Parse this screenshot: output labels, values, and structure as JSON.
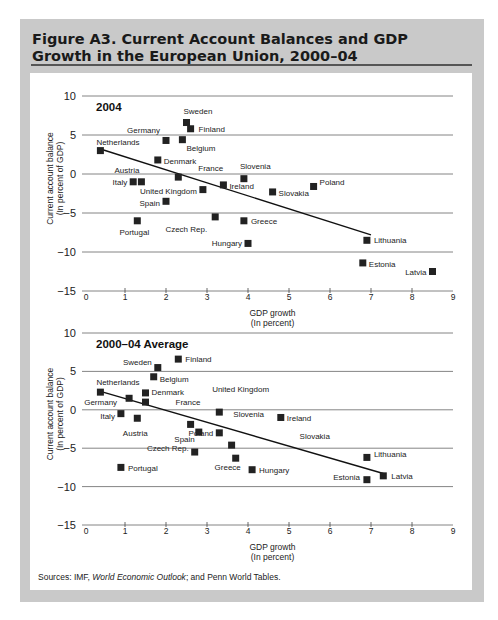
{
  "figure": {
    "title": "Figure A3.  Current Account Balances and GDP Growth in the European Union, 2000–04",
    "source_prefix": "Sources: IMF, ",
    "source_italic": "World Economic Outlook",
    "source_suffix": "; and Penn World Tables."
  },
  "colors": {
    "frame": "#c9c9c9",
    "marker": "#222222",
    "gridline": "#777777",
    "trendline": "#111111"
  },
  "chart_data": [
    {
      "type": "scatter",
      "title": "2004",
      "xlabel": "GDP growth (In percent)",
      "ylabel": "Current account balance (In percent of GDP)",
      "xlim": [
        0,
        9
      ],
      "ylim": [
        -15,
        10
      ],
      "xticks": [
        0,
        1,
        2,
        3,
        4,
        5,
        6,
        7,
        8,
        9
      ],
      "yticks": [
        10,
        5,
        0,
        -5,
        -10,
        -15
      ],
      "grid": "horizontal",
      "trendline": {
        "x": [
          0.4,
          7.0
        ],
        "y": [
          3.2,
          -7.8
        ]
      },
      "points": [
        {
          "label": "Netherlands",
          "x": 0.4,
          "y": 3.0
        },
        {
          "label": "Germany",
          "x": 2.0,
          "y": 4.3
        },
        {
          "label": "Sweden",
          "x": 2.5,
          "y": 6.6
        },
        {
          "label": "Finland",
          "x": 2.6,
          "y": 5.8
        },
        {
          "label": "Belgium",
          "x": 2.4,
          "y": 4.4
        },
        {
          "label": "Denmark",
          "x": 1.8,
          "y": 1.8
        },
        {
          "label": "France",
          "x": 2.3,
          "y": -0.4
        },
        {
          "label": "Austria",
          "x": 1.4,
          "y": -1.0
        },
        {
          "label": "Italy",
          "x": 1.2,
          "y": -1.0
        },
        {
          "label": "United Kingdom",
          "x": 2.9,
          "y": -2.0
        },
        {
          "label": "Spain",
          "x": 2.0,
          "y": -3.5
        },
        {
          "label": "Slovenia",
          "x": 3.9,
          "y": -0.6
        },
        {
          "label": "Ireland",
          "x": 3.4,
          "y": -1.4
        },
        {
          "label": "Slovakia",
          "x": 4.6,
          "y": -2.3
        },
        {
          "label": "Poland",
          "x": 5.6,
          "y": -1.6
        },
        {
          "label": "Portugal",
          "x": 1.3,
          "y": -6.0
        },
        {
          "label": "Czech Rep.",
          "x": 3.2,
          "y": -5.5
        },
        {
          "label": "Greece",
          "x": 3.9,
          "y": -6.0
        },
        {
          "label": "Hungary",
          "x": 4.0,
          "y": -8.9
        },
        {
          "label": "Lithuania",
          "x": 6.9,
          "y": -8.5
        },
        {
          "label": "Estonia",
          "x": 6.8,
          "y": -11.4
        },
        {
          "label": "Latvia",
          "x": 8.5,
          "y": -12.5
        }
      ]
    },
    {
      "type": "scatter",
      "title": "2000–04 Average",
      "xlabel": "GDP growth (In percent)",
      "ylabel": "Current account balance (In percent of GDP)",
      "xlim": [
        0,
        9
      ],
      "ylim": [
        -15,
        10
      ],
      "xticks": [
        0,
        1,
        2,
        3,
        4,
        5,
        6,
        7,
        8,
        9
      ],
      "yticks": [
        10,
        5,
        0,
        -5,
        -10,
        -15
      ],
      "grid": "horizontal",
      "trendline": {
        "x": [
          0.4,
          7.3
        ],
        "y": [
          2.4,
          -8.3
        ]
      },
      "points": [
        {
          "label": "Finland",
          "x": 2.3,
          "y": 6.6
        },
        {
          "label": "Sweden",
          "x": 1.8,
          "y": 5.5
        },
        {
          "label": "Belgium",
          "x": 1.7,
          "y": 4.3
        },
        {
          "label": "Netherlands",
          "x": 0.4,
          "y": 2.3
        },
        {
          "label": "Denmark",
          "x": 1.5,
          "y": 2.2
        },
        {
          "label": "Germany",
          "x": 1.1,
          "y": 1.5
        },
        {
          "label": "France",
          "x": 1.5,
          "y": 1.0
        },
        {
          "label": "Italy",
          "x": 0.9,
          "y": -0.5
        },
        {
          "label": "Austria",
          "x": 1.3,
          "y": -1.1
        },
        {
          "label": "United Kingdom",
          "x": 2.6,
          "y": -1.9
        },
        {
          "label": "Spain",
          "x": 2.8,
          "y": -2.9
        },
        {
          "label": "Slovenia",
          "x": 3.3,
          "y": -0.3
        },
        {
          "label": "Ireland",
          "x": 4.8,
          "y": -1.0
        },
        {
          "label": "Poland",
          "x": 3.3,
          "y": -3.0
        },
        {
          "label": "Slovakia",
          "x": 3.6,
          "y": -4.6
        },
        {
          "label": "Czech Rep.",
          "x": 2.7,
          "y": -5.5
        },
        {
          "label": "Greece",
          "x": 3.7,
          "y": -6.3
        },
        {
          "label": "Portugal",
          "x": 0.9,
          "y": -7.5
        },
        {
          "label": "Hungary",
          "x": 4.1,
          "y": -7.8
        },
        {
          "label": "Lithuania",
          "x": 6.9,
          "y": -6.2
        },
        {
          "label": "Latvia",
          "x": 7.3,
          "y": -8.6
        },
        {
          "label": "Estonia",
          "x": 6.9,
          "y": -9.1
        }
      ]
    }
  ]
}
